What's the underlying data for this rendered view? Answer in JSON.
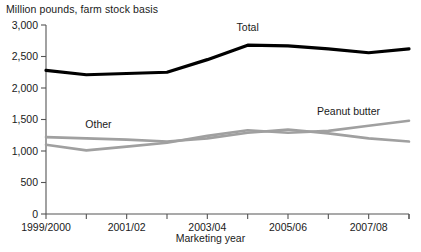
{
  "chart_data": {
    "type": "line",
    "title": "Million pounds, farm stock basis",
    "xlabel": "Marketing year",
    "ylabel": "",
    "ylim": [
      0,
      3000
    ],
    "yticks": [
      0,
      500,
      1000,
      1500,
      2000,
      2500,
      3000
    ],
    "ytick_labels": [
      "0",
      "500",
      "1,000",
      "1,500",
      "2,000",
      "2,500",
      "3,000"
    ],
    "grid": false,
    "legend_position": "inline-annotations",
    "x": [
      "1999/2000",
      "2000/01",
      "2001/02",
      "2002/03",
      "2003/04",
      "2004/05",
      "2005/06",
      "2006/07",
      "2007/08",
      "2008/09"
    ],
    "xtick_labels_shown": [
      "1999/2000",
      "2001/02",
      "2003/04",
      "2005/06",
      "2007/08"
    ],
    "xtick_label_indices": [
      0,
      2,
      4,
      6,
      8
    ],
    "series": [
      {
        "name": "Total",
        "color": "#000000",
        "width": 3.2,
        "values": [
          2280,
          2210,
          2230,
          2250,
          2450,
          2680,
          2670,
          2620,
          2560,
          2620
        ],
        "label_x_index": 5.0,
        "label_dy": -14
      },
      {
        "name": "Other",
        "color": "#a0a0a0",
        "width": 2.6,
        "values": [
          1220,
          1200,
          1180,
          1150,
          1200,
          1290,
          1340,
          1280,
          1200,
          1150
        ],
        "label_x_index": 1.3,
        "label_dy": -11
      },
      {
        "name": "Peanut butter",
        "color": "#a0a0a0",
        "width": 2.6,
        "values": [
          1100,
          1010,
          1070,
          1130,
          1240,
          1330,
          1290,
          1320,
          1400,
          1480
        ],
        "label_x_index": 7.5,
        "label_dy": -13
      }
    ]
  }
}
